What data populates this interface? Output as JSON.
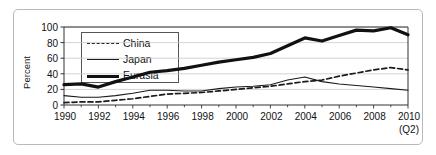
{
  "chart_data": {
    "type": "line",
    "title": "",
    "xlabel": "",
    "ylabel": "Percent",
    "x": [
      1990,
      1991,
      1992,
      1993,
      1994,
      1995,
      1996,
      1997,
      1998,
      1999,
      2000,
      2001,
      2002,
      2003,
      2004,
      2005,
      2006,
      2007,
      2008,
      2009,
      2010
    ],
    "xlim": [
      1990,
      2010
    ],
    "ylim": [
      0,
      100
    ],
    "grid": true,
    "legend_position": "upper-left",
    "x_tick_labels": [
      "1990",
      "1992",
      "1994",
      "1996",
      "1998",
      "2000",
      "2002",
      "2004",
      "2006",
      "2008",
      "2010"
    ],
    "x_tick_sublabel": "(Q2)",
    "y_tick_labels": [
      "0",
      "20",
      "40",
      "60",
      "80",
      "100"
    ],
    "y_ticks": [
      0,
      20,
      40,
      60,
      80,
      100
    ],
    "series": [
      {
        "name": "China",
        "style": "dashed",
        "values": [
          3,
          4,
          4,
          6,
          8,
          11,
          14,
          15,
          16,
          18,
          20,
          22,
          24,
          27,
          30,
          32,
          37,
          41,
          45,
          48,
          45
        ]
      },
      {
        "name": "Japan",
        "style": "thin-solid",
        "values": [
          12,
          10,
          10,
          12,
          15,
          19,
          19,
          18,
          18,
          21,
          23,
          24,
          26,
          32,
          36,
          30,
          27,
          25,
          23,
          21,
          19
        ]
      },
      {
        "name": "Eurasia",
        "style": "thick-solid",
        "values": [
          26,
          27,
          23,
          30,
          36,
          42,
          44,
          47,
          51,
          55,
          58,
          61,
          66,
          76,
          86,
          82,
          89,
          96,
          95,
          99,
          90
        ]
      }
    ]
  },
  "legend": {
    "items": [
      {
        "label": "China"
      },
      {
        "label": "Japan"
      },
      {
        "label": "Eurasia"
      }
    ]
  },
  "colors": {
    "series_china": "#1a1a1a",
    "series_japan": "#1a1a1a",
    "series_eurasia": "#111111",
    "grid": "#c8c8c8",
    "axis": "#333333",
    "frame": "#b9b9b9",
    "background": "#ffffff"
  }
}
